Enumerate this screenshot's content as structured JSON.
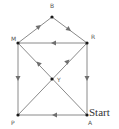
{
  "diagram": {
    "type": "directed-graph",
    "nodes": [
      {
        "id": "B",
        "label": "B",
        "x": 52,
        "y": 17,
        "lx": 52,
        "ly": 8
      },
      {
        "id": "M",
        "label": "M",
        "x": 18,
        "y": 43,
        "lx": 14,
        "ly": 40
      },
      {
        "id": "R",
        "label": "R",
        "x": 87,
        "y": 43,
        "lx": 92,
        "ly": 38
      },
      {
        "id": "Y",
        "label": "Y",
        "x": 52,
        "y": 79,
        "lx": 59,
        "ly": 81
      },
      {
        "id": "P",
        "label": "P",
        "x": 18,
        "y": 115,
        "lx": 13,
        "ly": 125
      },
      {
        "id": "A",
        "label": "A",
        "x": 87,
        "y": 115,
        "lx": 90,
        "ly": 125
      }
    ],
    "start_label": "Start",
    "edges": [
      {
        "from": "M",
        "to": "B"
      },
      {
        "from": "B",
        "to": "R"
      },
      {
        "from": "R",
        "to": "M"
      },
      {
        "from": "M",
        "to": "P"
      },
      {
        "from": "R",
        "to": "A"
      },
      {
        "from": "A",
        "to": "P"
      },
      {
        "from": "A",
        "to": "M",
        "via": "Y"
      },
      {
        "from": "P",
        "to": "R",
        "via": "Y"
      }
    ],
    "colors": {
      "edge": "#8a8a8a",
      "arrow": "#6f6f6f",
      "node": "#1a1a1a"
    }
  }
}
